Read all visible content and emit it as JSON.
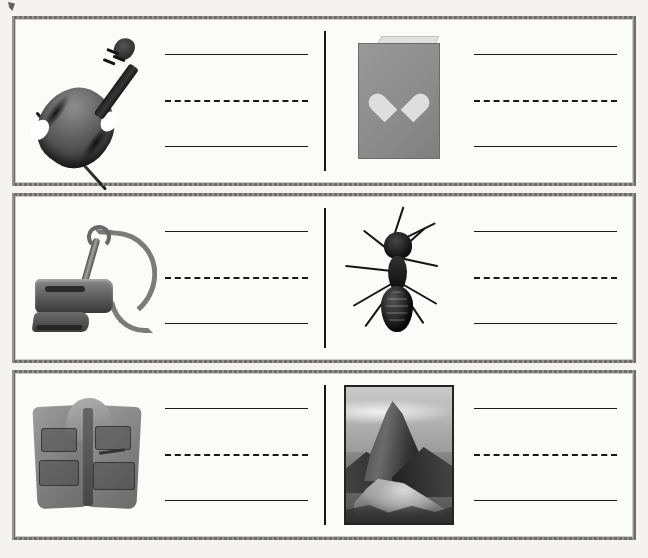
{
  "document": {
    "type": "handwriting-practice-worksheet",
    "artifact": "scan-speck"
  },
  "rows": [
    {
      "cells": [
        {
          "picture": "violin-photo",
          "subject": "violin",
          "lines": [
            "solid",
            "dashed",
            "solid"
          ]
        },
        {
          "picture": "greeting-card-photo",
          "subject": "card",
          "lines": [
            "solid",
            "dashed",
            "solid"
          ]
        }
      ]
    },
    {
      "cells": [
        {
          "picture": "vacuum-cleaner-photo",
          "subject": "vacuum",
          "lines": [
            "solid",
            "dashed",
            "solid"
          ]
        },
        {
          "picture": "ant-photo",
          "subject": "ant",
          "lines": [
            "solid",
            "dashed",
            "solid"
          ]
        }
      ]
    },
    {
      "cells": [
        {
          "picture": "vest-photo",
          "subject": "vest",
          "lines": [
            "solid",
            "dashed",
            "solid"
          ]
        },
        {
          "picture": "mountain-photo",
          "subject": "mountain",
          "lines": [
            "solid",
            "dashed",
            "solid"
          ]
        }
      ]
    }
  ],
  "colors": {
    "page_background": "#f4f3f1",
    "cell_background": "#fbfbfa",
    "frame_border": "#6e6b68",
    "rule_line": "#1a1a1a",
    "divider": "#151515",
    "card_gray": "#8e8b86",
    "card_heart": "#dbd9d4"
  }
}
